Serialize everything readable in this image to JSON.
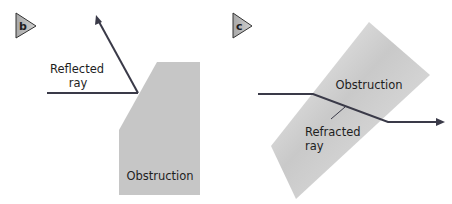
{
  "panels": [
    {
      "id": "b",
      "badge": "b",
      "labels": {
        "ray_line1": "Reflected",
        "ray_line2": "ray",
        "obstruction": "Obstruction"
      }
    },
    {
      "id": "c",
      "badge": "c",
      "labels": {
        "obstruction": "Obstruction",
        "ray_line1": "Refracted",
        "ray_line2": "ray"
      }
    }
  ],
  "colors": {
    "ray": "#3a3a48",
    "obstruction_fill": "#c4c4c4",
    "badge_fill": "#b5b5b5",
    "text": "#1e1e1e"
  }
}
